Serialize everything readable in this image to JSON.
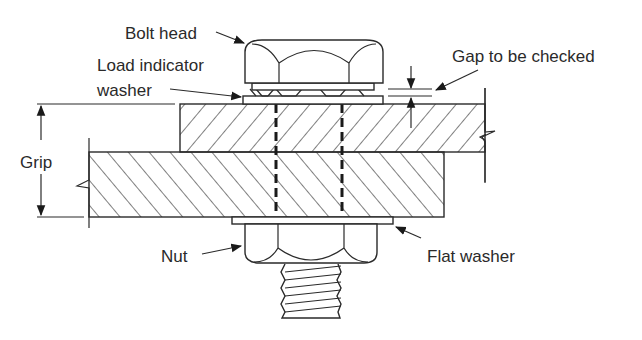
{
  "diagram": {
    "labels": {
      "bolt_head": "Bolt head",
      "load_indicator_line1": "Load indicator",
      "load_indicator_line2": "washer",
      "gap": "Gap to be checked",
      "grip": "Grip",
      "nut": "Nut",
      "flat_washer": "Flat washer"
    },
    "colors": {
      "stroke": "#2a2a2a",
      "background": "#ffffff"
    }
  }
}
